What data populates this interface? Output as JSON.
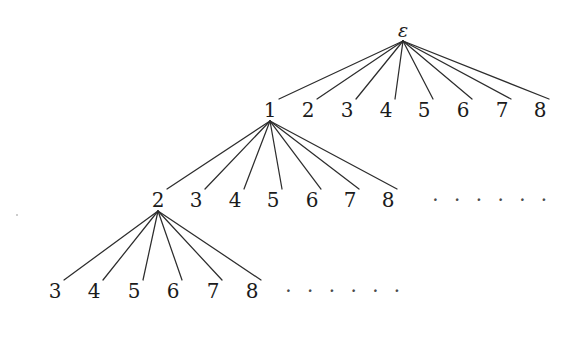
{
  "figure": {
    "kind": "infinite-branching-tree-diagram",
    "background_color": "#ffffff",
    "edge_color": "#2d2d2d",
    "label_color": "#1b1b1b",
    "ellipsis_color": "#4a4a4a",
    "width": 572,
    "height": 357
  },
  "nodes": {
    "root": {
      "label": "ε",
      "x": 403,
      "y": 30
    },
    "level1": [
      {
        "label": "1",
        "x": 270,
        "y": 110
      },
      {
        "label": "2",
        "x": 308,
        "y": 110
      },
      {
        "label": "3",
        "x": 347,
        "y": 110
      },
      {
        "label": "4",
        "x": 386,
        "y": 110
      },
      {
        "label": "5",
        "x": 424,
        "y": 110
      },
      {
        "label": "6",
        "x": 463,
        "y": 110
      },
      {
        "label": "7",
        "x": 502,
        "y": 110
      },
      {
        "label": "8",
        "x": 540,
        "y": 110
      }
    ],
    "level2": [
      {
        "label": "2",
        "x": 158,
        "y": 200
      },
      {
        "label": "3",
        "x": 196,
        "y": 200
      },
      {
        "label": "4",
        "x": 235,
        "y": 200
      },
      {
        "label": "5",
        "x": 273,
        "y": 200
      },
      {
        "label": "6",
        "x": 312,
        "y": 200
      },
      {
        "label": "7",
        "x": 350,
        "y": 200
      },
      {
        "label": "8",
        "x": 388,
        "y": 200
      }
    ],
    "level3": [
      {
        "label": "3",
        "x": 55,
        "y": 291
      },
      {
        "label": "4",
        "x": 94,
        "y": 291
      },
      {
        "label": "5",
        "x": 134,
        "y": 291
      },
      {
        "label": "6",
        "x": 173,
        "y": 291
      },
      {
        "label": "7",
        "x": 213,
        "y": 291
      },
      {
        "label": "8",
        "x": 252,
        "y": 291
      }
    ]
  },
  "ellipses": [
    {
      "text": "· · · · · ·",
      "x": 492,
      "y": 200
    },
    {
      "text": "· · · · · ·",
      "x": 345,
      "y": 291
    }
  ],
  "edges": {
    "from_root": {
      "parent_label": "ε",
      "child_labels": [
        "1",
        "2",
        "3",
        "4",
        "5",
        "6",
        "7",
        "8"
      ]
    },
    "from_node_1": {
      "parent_label": "1",
      "child_labels": [
        "2",
        "3",
        "4",
        "5",
        "6",
        "7",
        "8"
      ]
    },
    "from_node_2": {
      "parent_label": "2",
      "child_labels": [
        "3",
        "4",
        "5",
        "6",
        "7",
        "8"
      ]
    }
  }
}
